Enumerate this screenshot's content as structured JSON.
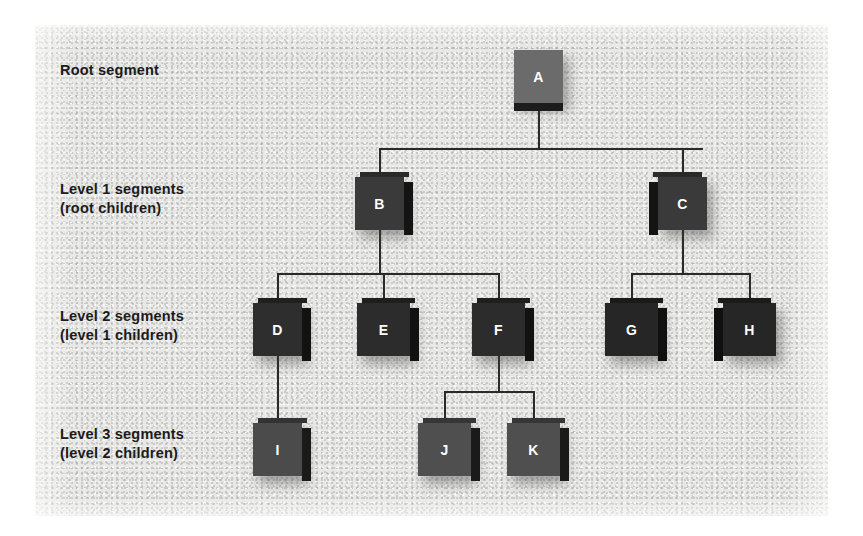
{
  "diagram": {
    "type": "tree",
    "background_color": "#e8e8e6",
    "line_color": "#2a2a2a",
    "label_color": "#1b1b1b",
    "node_label_color": "#ffffff",
    "row_labels": [
      {
        "id": "row-root",
        "text": "Root segment",
        "x": 25,
        "y": 36
      },
      {
        "id": "row-level1",
        "text": "Level 1 segments\n(root children)",
        "x": 25,
        "y": 155
      },
      {
        "id": "row-level2",
        "text": "Level 2 segments\n(level 1 children)",
        "x": 25,
        "y": 282
      },
      {
        "id": "row-level3",
        "text": "Level 3 segments\n(level 2 children)",
        "x": 25,
        "y": 400
      }
    ],
    "nodes": [
      {
        "id": "A",
        "label": "A",
        "level": 0,
        "x": 479,
        "y": 25,
        "w": 49,
        "h": 53,
        "face_color": "#6b6b6b",
        "side_color": "#1c1c1c",
        "depth": "bottom"
      },
      {
        "id": "B",
        "label": "B",
        "level": 1,
        "x": 320,
        "y": 152,
        "w": 49,
        "h": 53,
        "face_color": "#3a3a3a",
        "side_color": "#141414",
        "depth": "right"
      },
      {
        "id": "C",
        "label": "C",
        "level": 1,
        "x": 623,
        "y": 152,
        "w": 49,
        "h": 53,
        "face_color": "#3a3a3a",
        "side_color": "#141414",
        "depth": "left"
      },
      {
        "id": "D",
        "label": "D",
        "level": 2,
        "x": 218,
        "y": 278,
        "w": 49,
        "h": 53,
        "face_color": "#2e2e2e",
        "side_color": "#121212",
        "depth": "right"
      },
      {
        "id": "E",
        "label": "E",
        "level": 2,
        "x": 322,
        "y": 278,
        "w": 53,
        "h": 53,
        "face_color": "#2c2c2c",
        "side_color": "#121212",
        "depth": "right"
      },
      {
        "id": "F",
        "label": "F",
        "level": 2,
        "x": 437,
        "y": 278,
        "w": 53,
        "h": 53,
        "face_color": "#2c2c2c",
        "side_color": "#121212",
        "depth": "right"
      },
      {
        "id": "G",
        "label": "G",
        "level": 2,
        "x": 570,
        "y": 278,
        "w": 53,
        "h": 53,
        "face_color": "#262626",
        "side_color": "#101010",
        "depth": "right"
      },
      {
        "id": "H",
        "label": "H",
        "level": 2,
        "x": 688,
        "y": 278,
        "w": 53,
        "h": 53,
        "face_color": "#262626",
        "side_color": "#101010",
        "depth": "left"
      },
      {
        "id": "I",
        "label": "I",
        "level": 3,
        "x": 218,
        "y": 398,
        "w": 49,
        "h": 53,
        "face_color": "#4b4b4b",
        "side_color": "#1a1a1a",
        "depth": "right"
      },
      {
        "id": "J",
        "label": "J",
        "level": 3,
        "x": 383,
        "y": 398,
        "w": 53,
        "h": 53,
        "face_color": "#4f4f4f",
        "side_color": "#1a1a1a",
        "depth": "right"
      },
      {
        "id": "K",
        "label": "K",
        "level": 3,
        "x": 472,
        "y": 398,
        "w": 53,
        "h": 53,
        "face_color": "#4f4f4f",
        "side_color": "#1a1a1a",
        "depth": "right"
      }
    ],
    "edges": [
      {
        "from": "A",
        "to": "B"
      },
      {
        "from": "A",
        "to": "C"
      },
      {
        "from": "B",
        "to": "D"
      },
      {
        "from": "B",
        "to": "E"
      },
      {
        "from": "B",
        "to": "F"
      },
      {
        "from": "C",
        "to": "G"
      },
      {
        "from": "C",
        "to": "H"
      },
      {
        "from": "D",
        "to": "I"
      },
      {
        "from": "F",
        "to": "J"
      },
      {
        "from": "F",
        "to": "K"
      }
    ]
  }
}
